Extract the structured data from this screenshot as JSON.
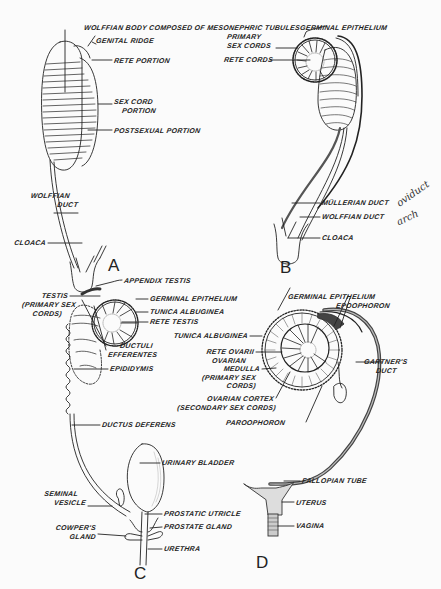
{
  "figure": {
    "panels": {
      "A": {
        "letter": "A",
        "labels": {
          "wolffian_body": "WOLFFIAN BODY COMPOSED OF MESONEPHRIC TUBULES",
          "genital_ridge": "GENITAL RIDGE",
          "rete_portion": "RETE PORTION",
          "sex_cord_1": "SEX CORD",
          "sex_cord_2": "PORTION",
          "postsexual": "POSTSEXUAL PORTION",
          "wolffian_duct_1": "WOLFFIAN",
          "wolffian_duct_2": "DUCT",
          "cloaca": "CLOACA"
        }
      },
      "B": {
        "letter": "B",
        "labels": {
          "germinal_epithelium": "GERMINAL EPITHELIUM",
          "primary_sex_cords_1": "PRIMARY",
          "primary_sex_cords_2": "SEX CORDS",
          "rete_cords": "RETE CORDS",
          "mullerian_duct": "MÜLLERIAN DUCT",
          "wolffian_duct": "WOLFFIAN DUCT",
          "cloaca": "CLOACA"
        },
        "handwritten": {
          "oviduct": "oviduct",
          "arch": "arch"
        }
      },
      "C": {
        "letter": "C",
        "labels": {
          "appendix_testis": "APPENDIX TESTIS",
          "testis_1": "TESTIS",
          "testis_2": "(PRIMARY SEX",
          "testis_3": "CORDS)",
          "germinal_epithelium": "GERMINAL EPITHELIUM",
          "tunica_albuginea": "TUNICA ALBUGINEA",
          "rete_testis": "RETE TESTIS",
          "ductuli_1": "DUCTULI",
          "ductuli_2": "EFFERENTES",
          "epididymis": "EPIDIDYMIS",
          "ductus_deferens": "DUCTUS DEFERENS",
          "urinary_bladder": "URINARY BLADDER",
          "seminal_vesicle_1": "SEMINAL",
          "seminal_vesicle_2": "VESICLE",
          "prostatic_utricle": "PROSTATIC UTRICLE",
          "prostate_gland": "PROSTATE GLAND",
          "cowpers_1": "COWPER'S",
          "cowpers_2": "GLAND",
          "urethra": "URETHRA"
        }
      },
      "D": {
        "letter": "D",
        "labels": {
          "germinal_epithelium": "GERMINAL EPITHELIUM",
          "epoophoron": "EPOOPHORON",
          "tunica_albuginea": "TUNICA ALBUGINEA",
          "rete_ovarii": "RETE OVARII",
          "medulla_1": "OVARIAN",
          "medulla_2": "MEDULLA",
          "medulla_3": "(PRIMARY SEX",
          "medulla_4": "CORDS)",
          "gartners_1": "GARTNER'S",
          "gartners_2": "DUCT",
          "cortex_1": "OVARIAN CORTEX",
          "cortex_2": "(SECONDARY SEX CORDS)",
          "paroophoron": "PAROOPHORON",
          "fallopian_tube": "FALLOPIAN TUBE",
          "uterus": "UTERUS",
          "vagina": "VAGINA"
        }
      }
    },
    "colors": {
      "ink": "#222222",
      "paper": "#fbfbfb",
      "shading": "#9a9a9a"
    }
  }
}
